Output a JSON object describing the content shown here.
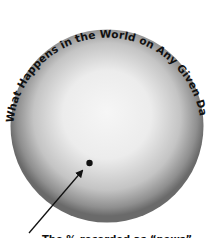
{
  "diagram": {
    "title": "What Happens in the World on Any Given Day",
    "caption": "The % recorded as “news”",
    "sphere": {
      "label": "world-events-sphere",
      "edge_color": "#6a6a6a",
      "center_color": "#f4f4f4"
    },
    "point": {
      "label": "news-dot",
      "color": "#111111"
    },
    "arrow": {
      "color": "#111111"
    }
  }
}
